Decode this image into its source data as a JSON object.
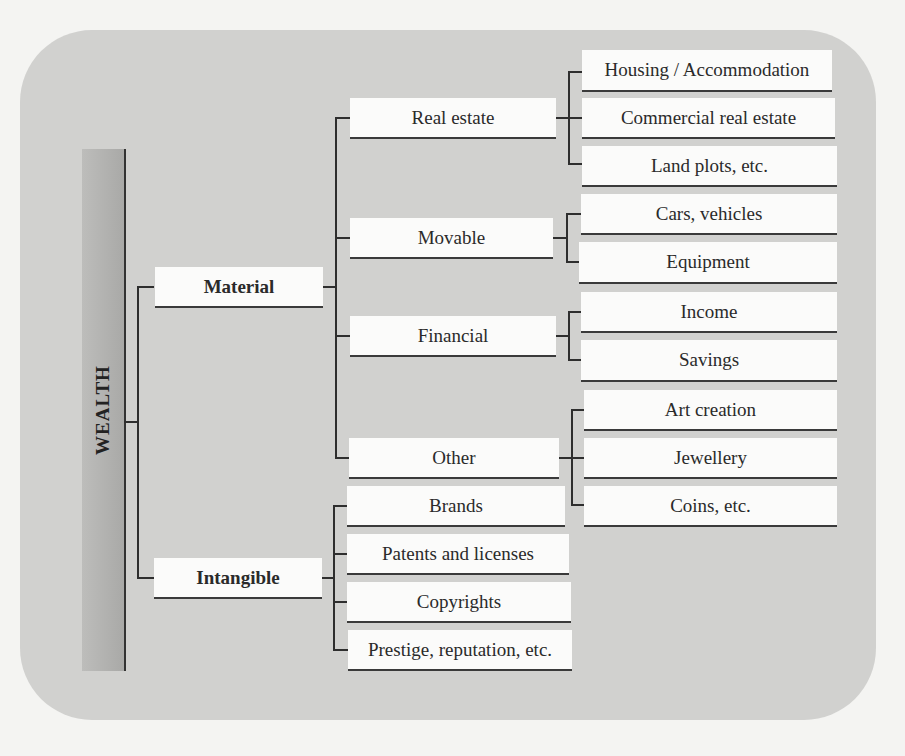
{
  "page": {
    "running_header": "ng ... p ... p ... y ... ",
    "background_text_fragments": [
      "ill understand",
      "of accommodation need among which are important",
      "is that accommodation ... the ... more ... ed",
      "... in the ... that ... and ... in ... of the ...",
      "The ... to the ... of ... in ... of",
      "of ... to the ... is ... to ...",
      "The results that ... to ... of the ...",
      "The ... the ... the ... of the ... of ... and ..."
    ]
  },
  "diagram": {
    "root": {
      "label": "WEALTH"
    },
    "branches": [
      {
        "label": "Material",
        "children": [
          {
            "label": "Real estate",
            "children": [
              "Housing / Accommodation",
              "Commercial real estate",
              "Land plots, etc."
            ]
          },
          {
            "label": "Movable",
            "children": [
              "Cars, vehicles",
              "Equipment"
            ]
          },
          {
            "label": "Financial",
            "children": [
              "Income",
              "Savings"
            ]
          },
          {
            "label": "Other",
            "children": [
              "Art creation",
              "Jewellery",
              "Coins, etc."
            ]
          }
        ]
      },
      {
        "label": "Intangible",
        "children": [
          {
            "label": "Brands"
          },
          {
            "label": "Patents and licenses"
          },
          {
            "label": "Copyrights"
          },
          {
            "label": "Prestige, reputation, etc."
          }
        ]
      }
    ]
  }
}
